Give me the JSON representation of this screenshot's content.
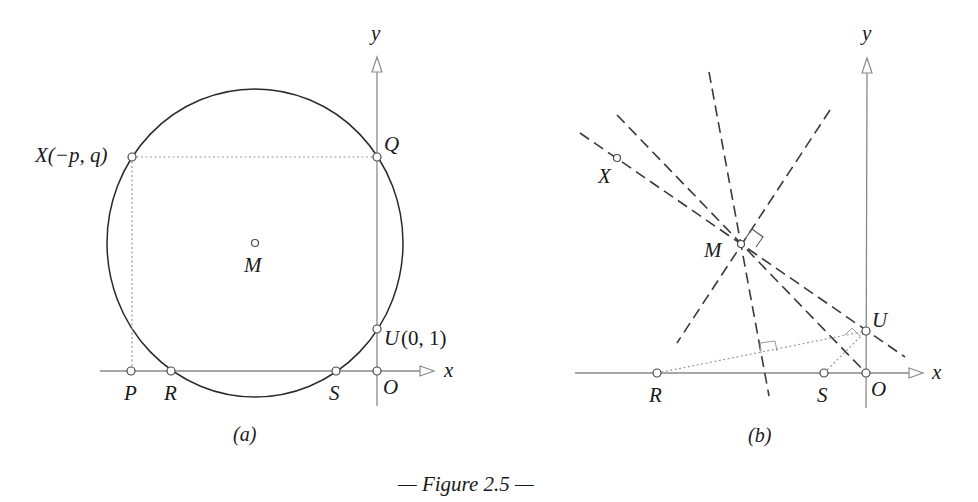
{
  "figure": {
    "caption": "— Figure 2.5 —",
    "panels": [
      {
        "id": "a",
        "sublabel": "(a)",
        "axes": {
          "x_label": "x",
          "y_label": "y"
        },
        "points": {
          "X": "X(−p, q)",
          "Q": "Q",
          "M": "M",
          "U": "U",
          "U_coords": "(0, 1)",
          "P": "P",
          "R": "R",
          "S": "S",
          "O": "O"
        },
        "elements": [
          "circle through X, Q, U, R, S",
          "dotted line X–Q",
          "dotted line X–P",
          "center M"
        ]
      },
      {
        "id": "b",
        "sublabel": "(b)",
        "axes": {
          "x_label": "x",
          "y_label": "y"
        },
        "points": {
          "X": "X",
          "M": "M",
          "U": "U",
          "R": "R",
          "S": "S",
          "O": "O"
        },
        "elements": [
          "dashed lines through M",
          "dotted line R–U with right-angle marks",
          "dotted line S–U",
          "right-angle mark at M"
        ]
      }
    ]
  },
  "colors": {
    "ink": "#1a1a1a",
    "axis": "#8a8a8a",
    "dotted": "#9a9a9a",
    "dashed": "#3a3a3a"
  }
}
